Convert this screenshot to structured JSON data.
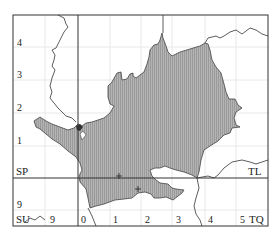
{
  "map": {
    "grid_squares": {
      "top_left": "SP",
      "top_right": "TL",
      "bottom_left": "SU",
      "bottom_right": "TQ"
    },
    "y_ticks_left": [
      "4",
      "3",
      "2",
      "1",
      "9"
    ],
    "x_ticks_bottom": [
      "9",
      "0",
      "1",
      "2",
      "3",
      "4",
      "5"
    ],
    "colors": {
      "shaded_region": "#a9a9a9",
      "frame": "#333333",
      "grid": "#e6e6e6"
    },
    "markers": [
      "cross",
      "cross"
    ]
  }
}
